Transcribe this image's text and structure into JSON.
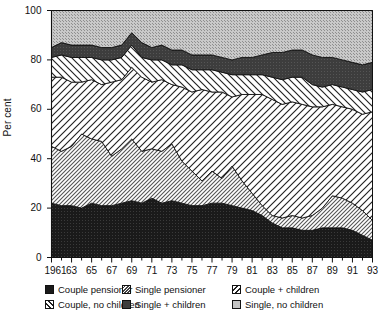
{
  "axes": {
    "ylabel": "Per cent",
    "yticks": [
      0,
      20,
      40,
      60,
      80,
      100
    ],
    "ymin": 0,
    "ymax": 100,
    "xtick_labels": [
      "1961",
      "63",
      "65",
      "67",
      "69",
      "71",
      "73",
      "75",
      "77",
      "79",
      "81",
      "83",
      "85",
      "87",
      "89",
      "91",
      "93"
    ],
    "xmin": 1961,
    "xmax": 1993
  },
  "legend": {
    "items": [
      {
        "label": "Couple pensioner",
        "pattern": "solid-black",
        "color": "#1a1a1a"
      },
      {
        "label": "Single pensioner",
        "pattern": "hatch-fine-down",
        "color": "#d8d8d8"
      },
      {
        "label": "Couple + children",
        "pattern": "hatch-wide-up",
        "color": "#ffffff"
      },
      {
        "label": "Couple, no children",
        "pattern": "hatch-wide-down",
        "color": "#ffffff"
      },
      {
        "label": "Single + children",
        "pattern": "solid-dark-grey",
        "color": "#3d3d3d"
      },
      {
        "label": "Single, no children",
        "pattern": "stipple-grey",
        "color": "#bdbdbd"
      }
    ]
  },
  "chart_data": {
    "type": "area",
    "title": "",
    "xlabel": "",
    "ylabel": "Per cent",
    "ylim": [
      0,
      100
    ],
    "grid": false,
    "stacked": true,
    "legend_position": "bottom",
    "x": [
      1961,
      1962,
      1963,
      1964,
      1965,
      1966,
      1967,
      1968,
      1969,
      1970,
      1971,
      1972,
      1973,
      1974,
      1975,
      1976,
      1977,
      1978,
      1979,
      1980,
      1981,
      1982,
      1983,
      1984,
      1985,
      1986,
      1987,
      1988,
      1989,
      1990,
      1991,
      1992,
      1993
    ],
    "series": [
      {
        "name": "Couple pensioner",
        "values": [
          22,
          21,
          21,
          20,
          22,
          21,
          21,
          22,
          23,
          22,
          24,
          22,
          23,
          22,
          21,
          21,
          22,
          22,
          21,
          20,
          19,
          17,
          14,
          12,
          12,
          11,
          11,
          12,
          12,
          12,
          11,
          9,
          7
        ]
      },
      {
        "name": "Single pensioner",
        "values": [
          23,
          22,
          24,
          30,
          26,
          26,
          20,
          22,
          25,
          21,
          20,
          21,
          23,
          17,
          14,
          10,
          13,
          10,
          16,
          11,
          7,
          4,
          3,
          4,
          5,
          5,
          6,
          8,
          13,
          12,
          11,
          10,
          8
        ]
      },
      {
        "name": "Couple + children",
        "values": [
          28,
          30,
          26,
          21,
          24,
          23,
          30,
          28,
          29,
          30,
          27,
          29,
          24,
          30,
          32,
          37,
          32,
          35,
          28,
          35,
          40,
          45,
          47,
          46,
          46,
          46,
          44,
          41,
          37,
          37,
          38,
          39,
          44
        ]
      },
      {
        "name": "Couple, no children",
        "values": [
          8,
          9,
          10,
          10,
          9,
          10,
          9,
          9,
          9,
          8,
          9,
          8,
          8,
          9,
          9,
          8,
          9,
          8,
          9,
          8,
          8,
          8,
          9,
          10,
          10,
          11,
          9,
          8,
          8,
          8,
          8,
          9,
          9
        ]
      },
      {
        "name": "Single + children",
        "values": [
          4,
          5,
          5,
          5,
          5,
          5,
          5,
          5,
          5,
          6,
          5,
          6,
          6,
          6,
          6,
          6,
          6,
          6,
          6,
          7,
          7,
          8,
          10,
          11,
          11,
          11,
          12,
          12,
          11,
          11,
          11,
          11,
          11
        ]
      },
      {
        "name": "Single, no children",
        "values": [
          15,
          13,
          14,
          14,
          14,
          15,
          15,
          14,
          9,
          13,
          15,
          14,
          16,
          16,
          18,
          18,
          18,
          19,
          20,
          19,
          19,
          18,
          17,
          17,
          16,
          16,
          18,
          19,
          19,
          20,
          21,
          22,
          21
        ]
      }
    ]
  }
}
